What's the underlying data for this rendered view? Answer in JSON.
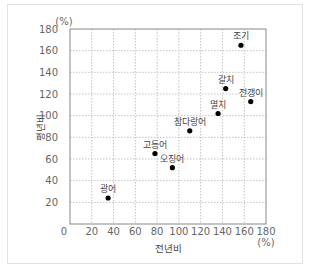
{
  "chart_data": {
    "type": "scatter",
    "title": "",
    "xlabel": "전년비",
    "ylabel": "평년비",
    "x_unit": "(%)",
    "y_unit": "(%)",
    "xlim": [
      0,
      180
    ],
    "ylim": [
      0,
      180
    ],
    "x_ticks": [
      0,
      20,
      40,
      60,
      80,
      100,
      120,
      140,
      160,
      180
    ],
    "y_ticks": [
      20,
      40,
      60,
      80,
      100,
      120,
      140,
      160,
      180
    ],
    "grid": true,
    "legend": null,
    "points": [
      {
        "label": "조기",
        "x": 157,
        "y": 165
      },
      {
        "label": "갈치",
        "x": 143,
        "y": 125
      },
      {
        "label": "전갱이",
        "x": 166,
        "y": 113
      },
      {
        "label": "멸치",
        "x": 136,
        "y": 102
      },
      {
        "label": "참다랑어",
        "x": 110,
        "y": 86
      },
      {
        "label": "고등어",
        "x": 78,
        "y": 65
      },
      {
        "label": "오징어",
        "x": 94,
        "y": 52
      },
      {
        "label": "광어",
        "x": 35,
        "y": 24
      }
    ]
  },
  "colors": {
    "grid": "#aaaaaa",
    "axis": "#888888",
    "point": "#000000",
    "panel_border": "#e2e2e2"
  }
}
